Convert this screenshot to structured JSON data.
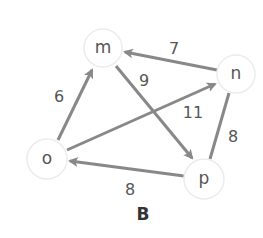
{
  "diagram": {
    "caption": "B",
    "colors": {
      "edge": "#888888",
      "node_stroke": "#ececec",
      "node_fill": "#ffffff",
      "label_text": "#555555",
      "caption_text": "#333333"
    },
    "nodes": [
      {
        "id": "m",
        "label": "m",
        "x": 103,
        "y": 48
      },
      {
        "id": "n",
        "label": "n",
        "x": 236,
        "y": 74
      },
      {
        "id": "o",
        "label": "o",
        "x": 47,
        "y": 159
      },
      {
        "id": "p",
        "label": "p",
        "x": 204,
        "y": 179
      }
    ],
    "edges": [
      {
        "from": "n",
        "to": "m",
        "weight": "7",
        "directed": true
      },
      {
        "from": "o",
        "to": "m",
        "weight": "6",
        "directed": true
      },
      {
        "from": "m",
        "to": "p",
        "weight": "9",
        "directed": true
      },
      {
        "from": "o",
        "to": "n",
        "weight": "11",
        "directed": true
      },
      {
        "from": "p",
        "to": "o",
        "weight": "8",
        "directed": true
      },
      {
        "from": "n",
        "to": "p",
        "weight": "8",
        "directed": false
      }
    ]
  }
}
